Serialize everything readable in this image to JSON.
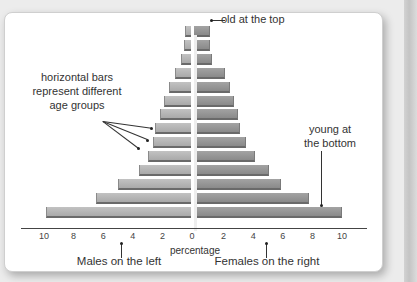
{
  "chart_data": {
    "type": "bar",
    "subtype": "population-pyramid",
    "title": "",
    "xlabel": "percentage",
    "ylabel": "",
    "x_ticks_left": [
      "10",
      "8",
      "6",
      "4",
      "2",
      "0"
    ],
    "x_ticks_right": [
      "2",
      "4",
      "6",
      "8",
      "10"
    ],
    "xlim": [
      -10,
      10
    ],
    "grid": false,
    "categories_top_to_bottom": [
      "bar1",
      "bar2",
      "bar3",
      "bar4",
      "bar5",
      "bar6",
      "bar7",
      "bar8",
      "bar9",
      "bar10",
      "bar11",
      "bar12",
      "bar13",
      "bar14"
    ],
    "series": [
      {
        "name": "Males",
        "side": "left",
        "values": [
          0.4,
          0.5,
          0.7,
          1.1,
          1.5,
          1.8,
          2.1,
          2.4,
          2.6,
          2.9,
          3.5,
          4.9,
          6.4,
          9.8
        ]
      },
      {
        "name": "Females",
        "side": "right",
        "values": [
          1.1,
          1.1,
          1.2,
          2.1,
          2.4,
          2.7,
          3.0,
          3.1,
          3.5,
          4.1,
          5.1,
          5.9,
          7.8,
          10.0
        ]
      }
    ]
  },
  "axis": {
    "label": "percentage"
  },
  "annotations": {
    "top": "old at the top",
    "bars_line1": "horizontal bars",
    "bars_line2": "represent different",
    "bars_line3": "age groups",
    "bottom_line1": "young at",
    "bottom_line2": "the bottom",
    "males": "Males on the left",
    "females": "Females on the right"
  }
}
